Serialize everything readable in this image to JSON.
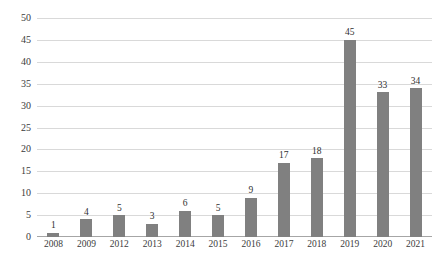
{
  "chart_data": {
    "type": "bar",
    "title": "",
    "subtitle": "",
    "xlabel": "",
    "ylabel": "",
    "categories": [
      "2008",
      "2009",
      "2012",
      "2013",
      "2014",
      "2015",
      "2016",
      "2017",
      "2018",
      "2019",
      "2020",
      "2021"
    ],
    "values": [
      1,
      4,
      5,
      3,
      6,
      5,
      9,
      17,
      18,
      45,
      33,
      34
    ],
    "data_labels": [
      "1",
      "4",
      "5",
      "3",
      "6",
      "5",
      "9",
      "17",
      "18",
      "45",
      "33",
      "34"
    ],
    "ylim": [
      0,
      50
    ],
    "ytick_step": 5,
    "ytick_labels": [
      "0",
      "5",
      "10",
      "15",
      "20",
      "25",
      "30",
      "35",
      "40",
      "45",
      "50"
    ],
    "ytick_values": [
      0,
      5,
      10,
      15,
      20,
      25,
      30,
      35,
      40,
      45,
      50
    ],
    "grid": true,
    "grid_axis": "y",
    "legend": false,
    "legend_position": "none",
    "bar_color": "#808080",
    "gridline_color": "#d9d9d9",
    "axis_color": "#a6a6a6",
    "label_color": "#3b3b3b",
    "background_color": "#ffffff"
  }
}
